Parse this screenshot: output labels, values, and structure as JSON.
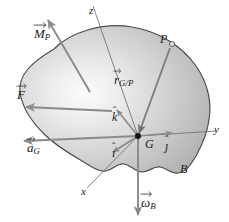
{
  "figure": {
    "kind": "rigid-body-kinetics-free-body-diagram",
    "labels": {
      "moment_M": "M",
      "moment_M_sub": "P",
      "force_F": "F",
      "accel_a": "a",
      "accel_a_sub": "G",
      "omega_w": "ω",
      "omega_w_sub": "B",
      "pos_r": "r",
      "pos_r_sub": "G/P",
      "point_P": "P",
      "point_G": "G",
      "body_B": "B",
      "axis_x": "x",
      "axis_y": "y",
      "axis_z": "z",
      "unit_i": "ı",
      "unit_j": "ȷ",
      "unit_k": "k",
      "hat_mark": "ˆ"
    },
    "colors": {
      "body_fill_light": "#f2f2f2",
      "body_fill_mid": "#c9c9c9",
      "body_fill_dark": "#b4b4b4",
      "outline": "#4a4a4a",
      "vector_gray": "#8a8a8a",
      "axis_thin": "#6e6e6e",
      "text": "#1a1a1a",
      "point_marker": "#111111",
      "background": "#ffffff"
    },
    "geometry": {
      "point_G": [
        138,
        136
      ],
      "point_P": [
        172,
        44
      ],
      "canvas": [
        229,
        222
      ]
    }
  }
}
